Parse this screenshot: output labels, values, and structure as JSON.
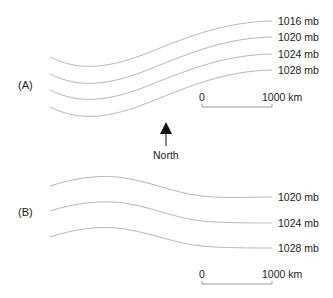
{
  "panels": [
    {
      "label": "(A)",
      "isobars": [
        "1016 mb",
        "1020 mb",
        "1024 mb",
        "1028 mb"
      ],
      "scale": {
        "start": "0",
        "end": "1000 km"
      }
    },
    {
      "label": "(B)",
      "isobars": [
        "1020 mb",
        "1024 mb",
        "1028 mb"
      ],
      "scale": {
        "start": "0",
        "end": "1000 km"
      }
    }
  ],
  "north_arrow": {
    "label": "North",
    "icon": "north-arrow-icon"
  },
  "colors": {
    "isobar": "#b8b8b8",
    "text": "#222222",
    "arrow": "#111111"
  }
}
